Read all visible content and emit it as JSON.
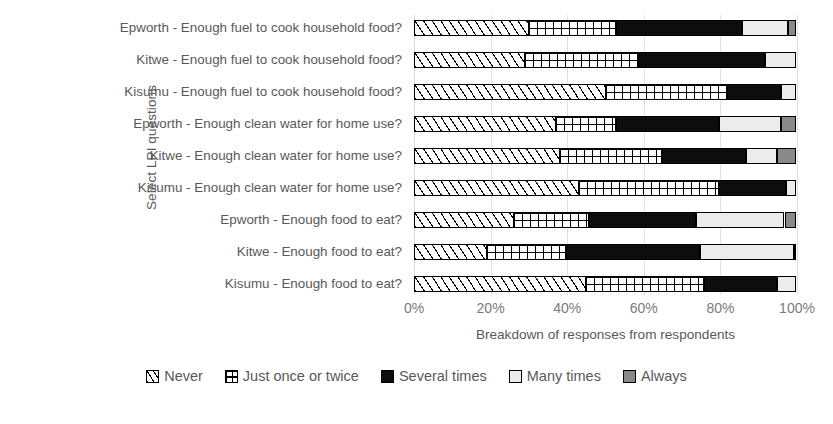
{
  "chart_data": {
    "type": "bar",
    "subtype": "stacked-horizontal-100-percent",
    "title": "",
    "xlabel": "Breakdown of responses from respondents",
    "ylabel": "Select LPI questions",
    "xlim": [
      0,
      100
    ],
    "xticks": [
      0,
      20,
      40,
      60,
      80,
      100
    ],
    "xticklabels": [
      "0%",
      "20%",
      "40%",
      "60%",
      "80%",
      "100%"
    ],
    "grid": true,
    "legend_position": "bottom",
    "categories": [
      "Epworth - Enough fuel to cook household food?",
      "Kitwe - Enough fuel to cook household food?",
      "Kisumu - Enough fuel to cook household food?",
      "Epworth - Enough clean water for home use?",
      "Kitwe - Enough clean water for home use?",
      "Kisumu - Enough clean water for home use?",
      "Epworth - Enough food to eat?",
      "Kitwe - Enough food to eat?",
      "Kisumu - Enough food to eat?"
    ],
    "series": [
      {
        "name": "Never",
        "pattern": "diagonal-hatch",
        "color": "#ffffff",
        "values": [
          30,
          29,
          50,
          37,
          38,
          43,
          26,
          19,
          45
        ]
      },
      {
        "name": "Just once or twice",
        "pattern": "cross-grid",
        "color": "#ffffff",
        "values": [
          23,
          30,
          32,
          16,
          27,
          37,
          20,
          21,
          31
        ]
      },
      {
        "name": "Several times",
        "pattern": "solid",
        "color": "#0d0d0d",
        "values": [
          33,
          33,
          14,
          27,
          22,
          17.5,
          28,
          35,
          19
        ]
      },
      {
        "name": "Many times",
        "pattern": "solid",
        "color": "#ececec",
        "values": [
          12,
          8,
          4,
          16,
          8,
          2.5,
          23,
          24.5,
          5
        ]
      },
      {
        "name": "Always",
        "pattern": "solid",
        "color": "#898989",
        "values": [
          2,
          0,
          0,
          4,
          5,
          0,
          3,
          0.5,
          0
        ]
      }
    ]
  },
  "axes": {
    "y_title": "Select LPI questions",
    "x_title": "Breakdown of responses from respondents"
  }
}
